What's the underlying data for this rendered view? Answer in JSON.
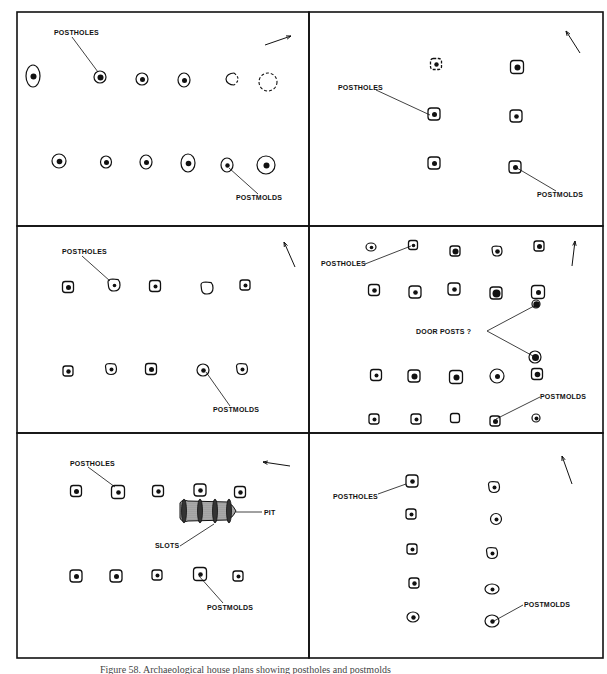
{
  "figure": {
    "border_color": "#111111",
    "caption_partial": "Figure 58. Archaeological house plans showing postholes and postmolds",
    "panels": [
      {
        "id": "panel-1",
        "box": [
          17,
          12,
          309,
          226
        ],
        "north_arrow": {
          "x1": 265,
          "y1": 45,
          "x2": 291,
          "y2": 36
        },
        "features": [
          {
            "type": "ellipse",
            "x": 33,
            "y": 76,
            "rx": 7,
            "ry": 11,
            "mold": 3
          },
          {
            "type": "ellipse",
            "x": 100,
            "y": 77,
            "rx": 6,
            "ry": 6,
            "mold": 3
          },
          {
            "type": "ellipse",
            "x": 142,
            "y": 79,
            "rx": 6,
            "ry": 6,
            "mold": 2.5
          },
          {
            "type": "ellipse",
            "x": 184,
            "y": 80,
            "rx": 6,
            "ry": 7,
            "mold": 2.5
          },
          {
            "type": "dashed-half",
            "x": 231,
            "y": 79,
            "rx": 8,
            "ry": 6
          },
          {
            "type": "dashed",
            "x": 268,
            "y": 82,
            "rx": 9,
            "ry": 9
          },
          {
            "type": "ellipse",
            "x": 59,
            "y": 161,
            "rx": 7,
            "ry": 7,
            "mold": 2.8
          },
          {
            "type": "ellipse",
            "x": 106,
            "y": 162,
            "rx": 5.5,
            "ry": 6,
            "mold": 2.5
          },
          {
            "type": "ellipse",
            "x": 146,
            "y": 162,
            "rx": 6,
            "ry": 7,
            "mold": 2.5
          },
          {
            "type": "ellipse",
            "x": 188,
            "y": 163,
            "rx": 7,
            "ry": 9,
            "mold": 2.8
          },
          {
            "type": "ellipse",
            "x": 227,
            "y": 165,
            "rx": 6,
            "ry": 7,
            "mold": 2.2
          },
          {
            "type": "ellipse",
            "x": 266,
            "y": 165,
            "rx": 9,
            "ry": 9,
            "mold": 3
          }
        ],
        "labels": [
          {
            "text": "POSTHOLES",
            "x": 54,
            "y": 35,
            "lx1": 72,
            "ly1": 37,
            "lx2": 98,
            "ly2": 72
          },
          {
            "text": "POSTMOLDS",
            "x": 236,
            "y": 200,
            "lx1": 258,
            "ly1": 194,
            "lx2": 229,
            "ly2": 168
          }
        ]
      },
      {
        "id": "panel-2",
        "box": [
          309,
          12,
          603,
          226
        ],
        "north_arrow": {
          "x1": 580,
          "y1": 53,
          "x2": 566,
          "y2": 31
        },
        "features": [
          {
            "type": "dashed-square",
            "x": 436,
            "y": 64,
            "s": 11,
            "mold": 2.2
          },
          {
            "type": "square",
            "x": 517,
            "y": 67,
            "s": 13,
            "mold": 3
          },
          {
            "type": "square",
            "x": 434,
            "y": 114,
            "s": 12,
            "mold": 2.5
          },
          {
            "type": "square",
            "x": 516,
            "y": 116,
            "s": 12,
            "mold": 2.3
          },
          {
            "type": "square",
            "x": 434,
            "y": 163,
            "s": 12,
            "mold": 2.5
          },
          {
            "type": "square",
            "x": 515,
            "y": 167,
            "s": 12,
            "mold": 2.5
          }
        ],
        "labels": [
          {
            "text": "POSTHOLES",
            "x": 338,
            "y": 90,
            "lx1": 376,
            "ly1": 90,
            "lx2": 430,
            "ly2": 115
          },
          {
            "text": "POSTMOLDS",
            "x": 537,
            "y": 197,
            "lx1": 556,
            "ly1": 191,
            "lx2": 517,
            "ly2": 168
          }
        ]
      },
      {
        "id": "panel-3",
        "box": [
          17,
          226,
          309,
          433
        ],
        "north_arrow": {
          "x1": 295,
          "y1": 267,
          "x2": 284,
          "y2": 242
        },
        "features": [
          {
            "type": "square",
            "x": 68,
            "y": 287,
            "s": 11,
            "mold": 2.5
          },
          {
            "type": "blob",
            "x": 114,
            "y": 285,
            "s": 12,
            "mold": 1.8
          },
          {
            "type": "square",
            "x": 155,
            "y": 286,
            "s": 11,
            "mold": 2
          },
          {
            "type": "blob",
            "x": 207,
            "y": 288,
            "s": 12,
            "mold": 0
          },
          {
            "type": "square",
            "x": 245,
            "y": 285,
            "s": 10,
            "mold": 2
          },
          {
            "type": "square",
            "x": 68,
            "y": 371,
            "s": 10,
            "mold": 2.2
          },
          {
            "type": "blob",
            "x": 111,
            "y": 369,
            "s": 11,
            "mold": 2
          },
          {
            "type": "square",
            "x": 151,
            "y": 369,
            "s": 11,
            "mold": 2.5
          },
          {
            "type": "ellipse",
            "x": 203,
            "y": 370,
            "rx": 6,
            "ry": 6,
            "mold": 2.3
          },
          {
            "type": "blob",
            "x": 242,
            "y": 369,
            "s": 11,
            "mold": 2
          }
        ],
        "labels": [
          {
            "text": "POSTHOLES",
            "x": 62,
            "y": 254,
            "lx1": 82,
            "ly1": 256,
            "lx2": 110,
            "ly2": 281
          },
          {
            "text": "POSTMOLDS",
            "x": 213,
            "y": 412,
            "lx1": 230,
            "ly1": 406,
            "lx2": 206,
            "ly2": 372
          }
        ]
      },
      {
        "id": "panel-4",
        "box": [
          309,
          226,
          603,
          433
        ],
        "north_arrow": {
          "x1": 572,
          "y1": 266,
          "x2": 575,
          "y2": 241
        },
        "features": [
          {
            "type": "ellipse",
            "x": 371,
            "y": 247,
            "rx": 5,
            "ry": 4,
            "mold": 1.8
          },
          {
            "type": "square",
            "x": 413,
            "y": 245,
            "s": 9,
            "mold": 1.8
          },
          {
            "type": "square",
            "x": 455,
            "y": 251,
            "s": 10,
            "mold": 3
          },
          {
            "type": "blob",
            "x": 497,
            "y": 251,
            "s": 10,
            "mold": 2.3
          },
          {
            "type": "square",
            "x": 539,
            "y": 246,
            "s": 10,
            "mold": 2.5
          },
          {
            "type": "square",
            "x": 374,
            "y": 290,
            "s": 11,
            "mold": 2.3
          },
          {
            "type": "square",
            "x": 415,
            "y": 292,
            "s": 12,
            "mold": 2.3
          },
          {
            "type": "square",
            "x": 454,
            "y": 289,
            "s": 12,
            "mold": 2.3
          },
          {
            "type": "square",
            "x": 496,
            "y": 293,
            "s": 12,
            "mold": 4
          },
          {
            "type": "square",
            "x": 538,
            "y": 292,
            "s": 13,
            "mold": 2.5
          },
          {
            "type": "ellipse",
            "x": 536,
            "y": 304,
            "rx": 4,
            "ry": 4,
            "mold": 3.2
          },
          {
            "type": "ellipse",
            "x": 535,
            "y": 357,
            "rx": 6,
            "ry": 6,
            "mold": 3.5
          },
          {
            "type": "square",
            "x": 376,
            "y": 375,
            "s": 11,
            "mold": 2
          },
          {
            "type": "square",
            "x": 414,
            "y": 376,
            "s": 12,
            "mold": 3
          },
          {
            "type": "square",
            "x": 456,
            "y": 377,
            "s": 13,
            "mold": 3
          },
          {
            "type": "ellipse",
            "x": 497,
            "y": 376,
            "rx": 7,
            "ry": 7,
            "mold": 2.5
          },
          {
            "type": "square",
            "x": 537,
            "y": 374,
            "s": 11,
            "mold": 2.8
          },
          {
            "type": "square",
            "x": 374,
            "y": 419,
            "s": 10,
            "mold": 2
          },
          {
            "type": "square",
            "x": 416,
            "y": 419,
            "s": 10,
            "mold": 2
          },
          {
            "type": "square",
            "x": 455,
            "y": 418,
            "s": 9,
            "mold": 0
          },
          {
            "type": "square",
            "x": 495,
            "y": 421,
            "s": 10,
            "mold": 2.5
          },
          {
            "type": "ellipse",
            "x": 536,
            "y": 418,
            "rx": 4,
            "ry": 4,
            "mold": 2
          }
        ],
        "labels": [
          {
            "text": "POSTHOLES",
            "x": 321,
            "y": 266,
            "lx1": 365,
            "ly1": 264,
            "lx2": 411,
            "ly2": 246
          },
          {
            "text": "DOOR  POSTS ?",
            "x": 416,
            "y": 334,
            "lx1": 487,
            "ly1": 331,
            "lx2": 534,
            "ly2": 306
          },
          {
            "text": "",
            "x": 0,
            "y": 0,
            "lx1": 487,
            "ly1": 331,
            "lx2": 533,
            "ly2": 356
          },
          {
            "text": "POSTMOLDS",
            "x": 540,
            "y": 399,
            "lx1": 540,
            "ly1": 397,
            "lx2": 496,
            "ly2": 419
          }
        ]
      },
      {
        "id": "panel-5",
        "box": [
          17,
          433,
          309,
          658
        ],
        "north_arrow": {
          "x1": 290,
          "y1": 466,
          "x2": 263,
          "y2": 462
        },
        "features": [
          {
            "type": "square",
            "x": 76,
            "y": 491,
            "s": 11,
            "mold": 2.5
          },
          {
            "type": "square",
            "x": 118,
            "y": 492,
            "s": 13,
            "mold": 2.3
          },
          {
            "type": "square",
            "x": 158,
            "y": 491,
            "s": 11,
            "mold": 2.2
          },
          {
            "type": "square",
            "x": 200,
            "y": 490,
            "s": 12,
            "mold": 2.3
          },
          {
            "type": "square",
            "x": 240,
            "y": 492,
            "s": 11,
            "mold": 2.2
          },
          {
            "type": "square",
            "x": 76,
            "y": 576,
            "s": 12,
            "mold": 2.5
          },
          {
            "type": "square",
            "x": 116,
            "y": 576,
            "s": 12,
            "mold": 2.5
          },
          {
            "type": "square",
            "x": 157,
            "y": 575,
            "s": 10,
            "mold": 2
          },
          {
            "type": "square",
            "x": 200,
            "y": 574,
            "s": 13,
            "mold": 2.3
          },
          {
            "type": "square",
            "x": 238,
            "y": 576,
            "s": 10,
            "mold": 2
          }
        ],
        "pit": {
          "x": 180,
          "y": 500,
          "w": 56,
          "h": 22,
          "label_x": 232,
          "label_line_to": 262
        },
        "labels": [
          {
            "text": "POSTHOLES",
            "x": 70,
            "y": 466,
            "lx1": 88,
            "ly1": 467,
            "lx2": 115,
            "ly2": 487
          },
          {
            "text": "PIT",
            "x": 264,
            "y": 515,
            "lx1": 236,
            "ly1": 512,
            "lx2": 262,
            "ly2": 512
          },
          {
            "text": "SLOTS",
            "x": 155,
            "y": 548,
            "lx1": 180,
            "ly1": 546,
            "lx2": 214,
            "ly2": 524
          },
          {
            "text": "POSTMOLDS",
            "x": 207,
            "y": 610,
            "lx1": 223,
            "ly1": 603,
            "lx2": 199,
            "ly2": 576
          }
        ]
      },
      {
        "id": "panel-6",
        "box": [
          309,
          433,
          603,
          658
        ],
        "north_arrow": {
          "x1": 572,
          "y1": 484,
          "x2": 562,
          "y2": 456
        },
        "features": [
          {
            "type": "square",
            "x": 412,
            "y": 481,
            "s": 12,
            "mold": 2.3
          },
          {
            "type": "blob",
            "x": 494,
            "y": 487,
            "s": 11,
            "mold": 2
          },
          {
            "type": "square",
            "x": 411,
            "y": 514,
            "s": 10,
            "mold": 2
          },
          {
            "type": "ellipse",
            "x": 496,
            "y": 519,
            "rx": 5.5,
            "ry": 5.5,
            "mold": 2
          },
          {
            "type": "square",
            "x": 412,
            "y": 549,
            "s": 10,
            "mold": 2
          },
          {
            "type": "blob",
            "x": 492,
            "y": 553,
            "s": 11,
            "mold": 2
          },
          {
            "type": "square",
            "x": 414,
            "y": 583,
            "s": 10,
            "mold": 2.2
          },
          {
            "type": "ellipse",
            "x": 492,
            "y": 589,
            "rx": 7,
            "ry": 5,
            "mold": 2
          },
          {
            "type": "ellipse",
            "x": 413,
            "y": 617,
            "rx": 6,
            "ry": 5,
            "mold": 2.2
          },
          {
            "type": "ellipse",
            "x": 492,
            "y": 621,
            "rx": 7,
            "ry": 6,
            "mold": 2.2
          }
        ],
        "labels": [
          {
            "text": "POSTHOLES",
            "x": 333,
            "y": 499,
            "lx1": 378,
            "ly1": 494,
            "lx2": 406,
            "ly2": 484
          },
          {
            "text": "POSTMOLDS",
            "x": 524,
            "y": 607,
            "lx1": 523,
            "ly1": 605,
            "lx2": 494,
            "ly2": 621
          }
        ]
      }
    ]
  }
}
